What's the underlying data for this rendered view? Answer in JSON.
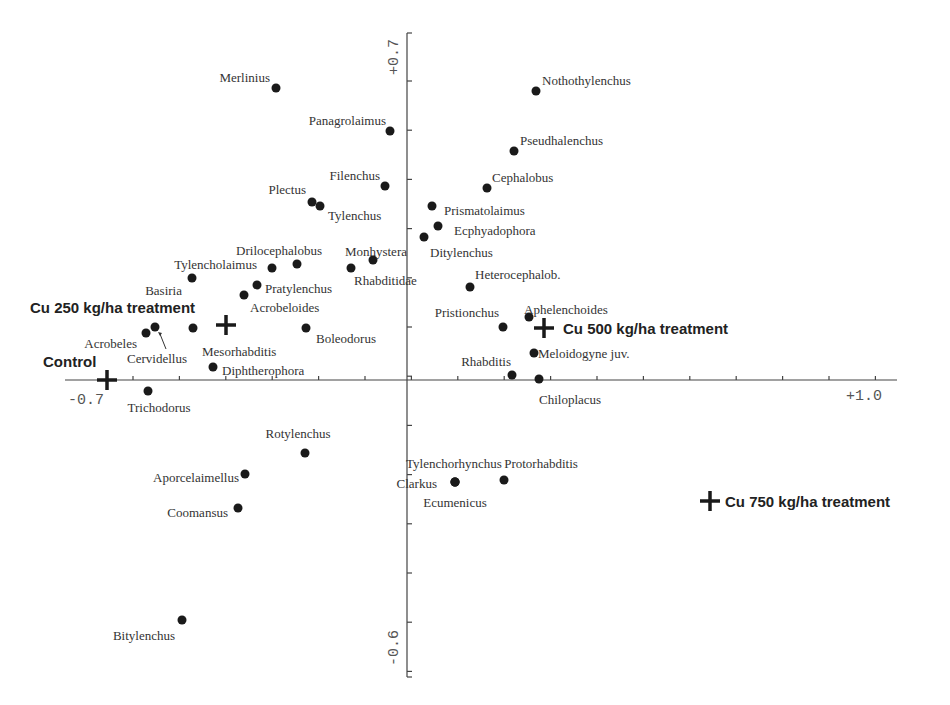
{
  "chart_data": {
    "type": "scatter",
    "title": "",
    "xlabel": "",
    "ylabel": "",
    "xlim": [
      -0.7,
      1.0
    ],
    "ylim": [
      -0.6,
      0.7
    ],
    "grid": false,
    "legend": null,
    "axis_tick_labels": {
      "x_min": "-0.7",
      "x_max": "+1.0",
      "y_max": "+0.7",
      "y_min": "-0.6"
    },
    "pixel_map": {
      "x0_px": 108,
      "x0_val": -0.7,
      "x1_px": 897,
      "x1_val": 1.0,
      "y0_px": 35,
      "y0_val": 0.7,
      "y1_px": 675,
      "y1_val": -0.6,
      "xaxis_y_px": 380,
      "yaxis_x_px": 407
    },
    "species": [
      {
        "name": "Merlinius",
        "px": 276,
        "py": 88,
        "lx": -6,
        "ly": -6,
        "anchor": "end"
      },
      {
        "name": "Nothothylenchus",
        "px": 536,
        "py": 91,
        "lx": 6,
        "ly": -6,
        "anchor": "start"
      },
      {
        "name": "Panagrolaimus",
        "px": 390,
        "py": 131,
        "lx": -4,
        "ly": -6,
        "anchor": "end"
      },
      {
        "name": "Pseudhalenchus",
        "px": 514,
        "py": 151,
        "lx": 6,
        "ly": -6,
        "anchor": "start"
      },
      {
        "name": "Filenchus",
        "px": 385,
        "py": 186,
        "lx": -5,
        "ly": -6,
        "anchor": "end"
      },
      {
        "name": "Cephalobus",
        "px": 487,
        "py": 188,
        "lx": 5,
        "ly": -6,
        "anchor": "start"
      },
      {
        "name": "Plectus",
        "px": 312,
        "py": 202,
        "lx": -6,
        "ly": -8,
        "anchor": "end"
      },
      {
        "name": "Tylenchus",
        "px": 320,
        "py": 206,
        "lx": 8,
        "ly": 14,
        "anchor": "start"
      },
      {
        "name": "Prismatolaimus",
        "px": 432,
        "py": 206,
        "lx": 12,
        "ly": 9,
        "anchor": "start"
      },
      {
        "name": "Ecphyadophora",
        "px": 438,
        "py": 226,
        "lx": 16,
        "ly": 9,
        "anchor": "start"
      },
      {
        "name": "Ditylenchus",
        "px": 424,
        "py": 237,
        "lx": 6,
        "ly": 20,
        "anchor": "start"
      },
      {
        "name": "Drilocephalobus",
        "px": 272,
        "py": 268,
        "lx": 50,
        "ly": -13,
        "anchor": "end"
      },
      {
        "name": "Monhystera",
        "px": 373,
        "py": 260,
        "lx": 34,
        "ly": -4,
        "anchor": "end"
      },
      {
        "name": "Tylencholaimus",
        "px": 297,
        "py": 264,
        "lx": -40,
        "ly": 5,
        "anchor": "end"
      },
      {
        "name": "Rhabditidae",
        "px": 351,
        "py": 268,
        "lx": 3,
        "ly": 17,
        "anchor": "start"
      },
      {
        "name": "Basiria",
        "px": 192,
        "py": 278,
        "lx": -10,
        "ly": 17,
        "anchor": "end"
      },
      {
        "name": "Pratylenchus",
        "px": 257,
        "py": 285,
        "lx": 8,
        "ly": 8,
        "anchor": "start"
      },
      {
        "name": "Acrobeloides",
        "px": 244,
        "py": 295,
        "lx": 6,
        "ly": 17,
        "anchor": "start"
      },
      {
        "name": "Heterocephalob.",
        "px": 470,
        "py": 287,
        "lx": 5,
        "ly": -8,
        "anchor": "start"
      },
      {
        "name": "Aphelenchoides",
        "px": 529,
        "py": 317,
        "lx": -5,
        "ly": -3,
        "anchor": "start"
      },
      {
        "name": "Pristionchus",
        "px": 503,
        "py": 327,
        "lx": -4,
        "ly": -10,
        "anchor": "end"
      },
      {
        "name": "Boleodorus",
        "px": 306,
        "py": 328,
        "lx": 10,
        "ly": 15,
        "anchor": "start"
      },
      {
        "name": "Acrobeles",
        "px": 146,
        "py": 333,
        "lx": -9,
        "ly": 15,
        "anchor": "end"
      },
      {
        "name": "Cervidellus",
        "px": 155,
        "py": 327,
        "lx": 32,
        "ly": 36,
        "anchor": "end",
        "arrow": true
      },
      {
        "name": "Mesorhabditis",
        "px": 193,
        "py": 328,
        "lx": 9,
        "ly": 28,
        "anchor": "start"
      },
      {
        "name": "Meloidogyne juv.",
        "px": 534,
        "py": 353,
        "lx": 4,
        "ly": 5,
        "anchor": "start"
      },
      {
        "name": "Diphtherophora",
        "px": 213,
        "py": 367,
        "lx": 9,
        "ly": 8,
        "anchor": "start"
      },
      {
        "name": "Rhabditis",
        "px": 512,
        "py": 375,
        "lx": -1,
        "ly": -9,
        "anchor": "end"
      },
      {
        "name": "Chiloplacus",
        "px": 539,
        "py": 379,
        "lx": 0,
        "ly": 25,
        "anchor": "start"
      },
      {
        "name": "Trichodorus",
        "px": 148,
        "py": 391,
        "lx": 11,
        "ly": 21,
        "anchor": "middle"
      },
      {
        "name": "Rotylenchus",
        "px": 305,
        "py": 453,
        "lx": -7,
        "ly": -15,
        "anchor": "middle"
      },
      {
        "name": "Aporcelaimellus",
        "px": 245,
        "py": 474,
        "lx": -6,
        "ly": 8,
        "anchor": "end"
      },
      {
        "name": "Tylenchorhynchus",
        "px": 455,
        "py": 482,
        "lx": -1,
        "ly": -14,
        "anchor": "middle"
      },
      {
        "name": "Clarkus",
        "px": 455,
        "py": 482,
        "lx": -18,
        "ly": 6,
        "anchor": "end"
      },
      {
        "name": "Ecumenicus",
        "px": 455,
        "py": 482,
        "lx": 0,
        "ly": 25,
        "anchor": "middle"
      },
      {
        "name": "Protorhabditis",
        "px": 504,
        "py": 480,
        "lx": 37,
        "ly": -12,
        "anchor": "middle"
      },
      {
        "name": "Coomansus",
        "px": 238,
        "py": 508,
        "lx": -10,
        "ly": 9,
        "anchor": "end"
      },
      {
        "name": "Bitylenchus",
        "px": 182,
        "py": 620,
        "lx": -38,
        "ly": 20,
        "anchor": "middle"
      }
    ],
    "treatments": [
      {
        "name": "Control",
        "px": 107,
        "py": 380,
        "lx": -64,
        "ly": -13
      },
      {
        "name": "Cu 250 kg/ha treatment",
        "px": 226,
        "py": 325,
        "lx": -196,
        "ly": -12
      },
      {
        "name": "Cu 500 kg/ha treatment",
        "px": 544,
        "py": 328,
        "lx": 19,
        "ly": 6
      },
      {
        "name": "Cu 750 kg/ha treatment",
        "px": 710,
        "py": 501,
        "lx": 15,
        "ly": 6
      }
    ],
    "approx_values": {
      "species": [
        {
          "name": "Merlinius",
          "x": -0.31,
          "y": 0.59
        },
        {
          "name": "Nothothylenchus",
          "x": 0.25,
          "y": 0.58
        },
        {
          "name": "Panagrolaimus",
          "x": -0.06,
          "y": 0.5
        },
        {
          "name": "Pseudhalenchus",
          "x": 0.2,
          "y": 0.46
        },
        {
          "name": "Filenchus",
          "x": -0.07,
          "y": 0.39
        },
        {
          "name": "Cephalobus",
          "x": 0.15,
          "y": 0.39
        },
        {
          "name": "Plectus",
          "x": -0.23,
          "y": 0.36
        },
        {
          "name": "Tylenchus",
          "x": -0.21,
          "y": 0.35
        },
        {
          "name": "Prismatolaimus",
          "x": 0.03,
          "y": 0.35
        },
        {
          "name": "Ecphyadophora",
          "x": 0.04,
          "y": 0.31
        },
        {
          "name": "Ditylenchus",
          "x": 0.01,
          "y": 0.29
        },
        {
          "name": "Drilocephalobus",
          "x": -0.32,
          "y": 0.23
        },
        {
          "name": "Monhystera",
          "x": -0.09,
          "y": 0.24
        },
        {
          "name": "Tylencholaimus",
          "x": -0.26,
          "y": 0.23
        },
        {
          "name": "Rhabditidae",
          "x": -0.14,
          "y": 0.23
        },
        {
          "name": "Basiria",
          "x": -0.49,
          "y": 0.21
        },
        {
          "name": "Pratylenchus",
          "x": -0.35,
          "y": 0.19
        },
        {
          "name": "Acrobeloides",
          "x": -0.38,
          "y": 0.17
        },
        {
          "name": "Heterocephalob.",
          "x": 0.12,
          "y": 0.19
        },
        {
          "name": "Aphelenchoides",
          "x": 0.24,
          "y": 0.13
        },
        {
          "name": "Pristionchus",
          "x": 0.18,
          "y": 0.11
        },
        {
          "name": "Boleodorus",
          "x": -0.26,
          "y": 0.1
        },
        {
          "name": "Acrobeles",
          "x": -0.6,
          "y": 0.09
        },
        {
          "name": "Cervidellus",
          "x": -0.58,
          "y": 0.11
        },
        {
          "name": "Mesorhabditis",
          "x": -0.49,
          "y": 0.1
        },
        {
          "name": "Meloidogyne juv.",
          "x": 0.24,
          "y": 0.05
        },
        {
          "name": "Diphtherophora",
          "x": -0.45,
          "y": 0.03
        },
        {
          "name": "Rhabditis",
          "x": 0.2,
          "y": 0.01
        },
        {
          "name": "Chiloplacus",
          "x": 0.26,
          "y": 0.0
        },
        {
          "name": "Trichodorus",
          "x": -0.6,
          "y": -0.02
        },
        {
          "name": "Rotylenchus",
          "x": -0.26,
          "y": -0.15
        },
        {
          "name": "Aporcelaimellus",
          "x": -0.39,
          "y": -0.19
        },
        {
          "name": "Clarkus / Tylenchorhynchus / Ecumenicus",
          "x": 0.1,
          "y": -0.21
        },
        {
          "name": "Protorhabditis",
          "x": 0.18,
          "y": -0.2
        },
        {
          "name": "Coomansus",
          "x": -0.41,
          "y": -0.26
        },
        {
          "name": "Bitylenchus",
          "x": -0.53,
          "y": -0.49
        }
      ],
      "treatments": [
        {
          "name": "Control",
          "x": -0.7,
          "y": 0.0
        },
        {
          "name": "Cu 250 kg/ha treatment",
          "x": -0.44,
          "y": 0.11
        },
        {
          "name": "Cu 500 kg/ha treatment",
          "x": 0.25,
          "y": 0.1
        },
        {
          "name": "Cu 750 kg/ha treatment",
          "x": 0.61,
          "y": -0.25
        }
      ]
    }
  }
}
